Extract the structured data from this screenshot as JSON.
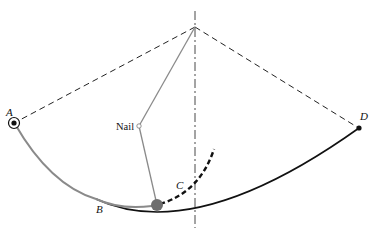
{
  "diagram": {
    "labels": {
      "a": "A",
      "b": "B",
      "c": "C",
      "d": "D",
      "nail": "Nail"
    },
    "colors": {
      "ink": "#111111",
      "string": "#8a8a8a",
      "bob": "#6e6e6e",
      "swing_path": "#8a8a8a"
    },
    "points": {
      "pivot": [
        195,
        27
      ],
      "a": [
        14,
        123
      ],
      "d": [
        359,
        128
      ],
      "nail": [
        139,
        126
      ],
      "bob": [
        157,
        205
      ]
    }
  }
}
